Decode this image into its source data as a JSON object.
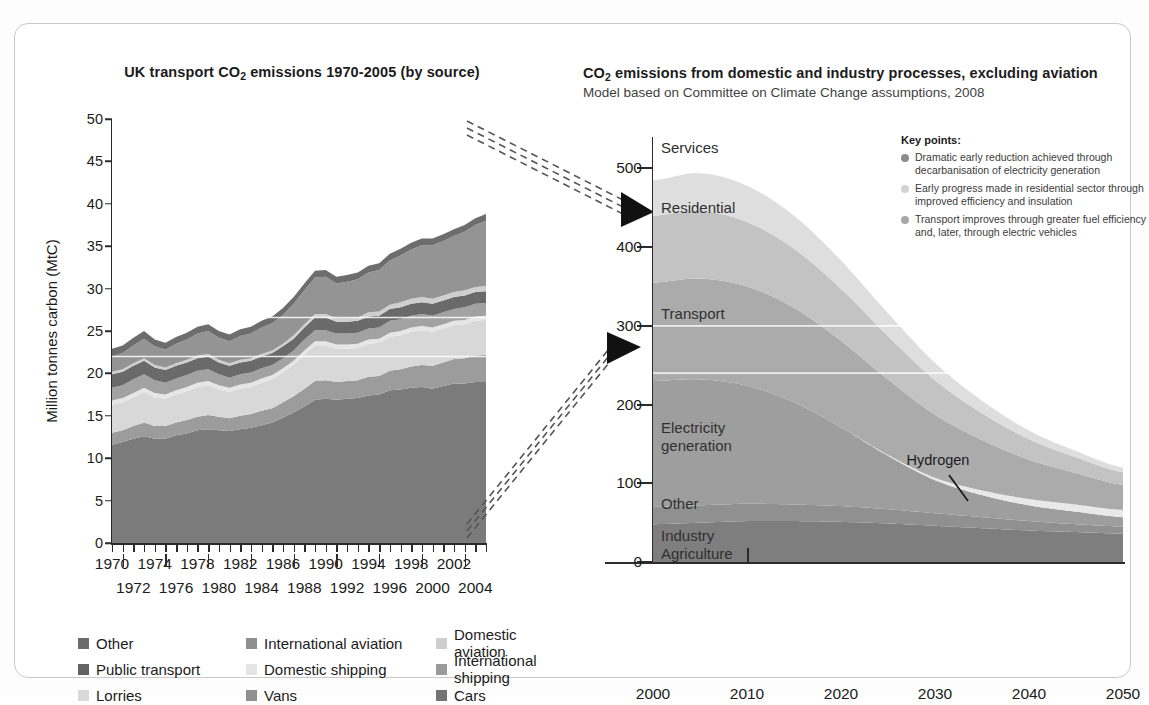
{
  "left": {
    "title_pre": "UK transport CO",
    "title_sub": "2",
    "title_post": " emissions 1970-2005 (by source)",
    "ylabel": "Million tonnes carbon (MtC)",
    "yticks": [
      "0",
      "5",
      "10",
      "15",
      "20",
      "25",
      "30",
      "35",
      "40",
      "45",
      "50"
    ],
    "years_top": [
      "1970",
      "1974",
      "1978",
      "1982",
      "1986",
      "1990",
      "1994",
      "1998",
      "2002"
    ],
    "years_bottom": [
      "1972",
      "1976",
      "1980",
      "1984",
      "1988",
      "1992",
      "1996",
      "2000",
      "2004"
    ]
  },
  "right": {
    "title_pre": "CO",
    "title_sub": "2",
    "title_post": " emissions from domestic and industry processes, excluding aviation",
    "subtitle": "Model based on Committee on Climate Change assumptions, 2008",
    "yticks": [
      "0",
      "100",
      "200",
      "300",
      "400",
      "500"
    ],
    "xticks": [
      "2000",
      "2010",
      "2020",
      "2030",
      "2040",
      "2050"
    ],
    "band_labels": [
      "Services",
      "Residential",
      "Transport",
      "Electricity",
      "generation",
      "Other",
      "Industry",
      "Agriculture"
    ],
    "annotation": "Hydrogen",
    "keypoints": {
      "heading": "Key points:",
      "items": [
        "Dramatic early reduction achieved through decarbanisation of electricity generation",
        "Early progress made in residential sector through improved efficiency and insulation",
        "Transport improves through greater fuel efficiency and, later, through electric vehicles"
      ],
      "dot_colors": [
        "#8c8c8c",
        "#d2d2d2",
        "#a8a8a8"
      ]
    }
  },
  "legend": {
    "items": [
      {
        "label": "Other",
        "color": "#6b6b6b"
      },
      {
        "label": "Public transport",
        "color": "#636363"
      },
      {
        "label": "Lorries",
        "color": "#d9d9d9"
      },
      {
        "label": "International aviation",
        "color": "#8f8f8f"
      },
      {
        "label": "Domestic shipping",
        "color": "#e4e4e4"
      },
      {
        "label": "Vans",
        "color": "#909090"
      },
      {
        "label": "Domestic aviation",
        "color": "#cfcfcf"
      },
      {
        "label": "International shipping",
        "color": "#9a9a9a"
      },
      {
        "label": "Cars",
        "color": "#737373"
      }
    ]
  },
  "colors": {
    "cars": "#7b7b7b",
    "vans": "#9c9c9c",
    "lorries": "#d8d8d8",
    "domestic_shipping": "#e6e6e6",
    "intl_shipping": "#a2a2a2",
    "public_transport": "#6a6a6a",
    "domestic_aviation": "#cfcfcf",
    "intl_aviation": "#949494",
    "other": "#6d6d6d",
    "r_agri_industry": "#7e7e7e",
    "r_other": "#909090",
    "r_electricity": "#9e9e9e",
    "r_hydrogen": "#e9e9e9",
    "r_transport": "#ababab",
    "r_residential": "#c3c3c3",
    "r_services": "#dedede"
  },
  "chart_data": [
    {
      "type": "area",
      "stacked": true,
      "title": "UK transport CO2 emissions 1970-2005 (by source)",
      "xlabel": "",
      "ylabel": "Million tonnes carbon (MtC)",
      "ylim": [
        0,
        50
      ],
      "xlim": [
        1970,
        2005
      ],
      "grid": false,
      "legend_position": "bottom",
      "yticks": [
        0,
        5,
        10,
        15,
        20,
        25,
        30,
        35,
        40,
        45,
        50
      ],
      "x": [
        1970,
        1971,
        1972,
        1973,
        1974,
        1975,
        1976,
        1977,
        1978,
        1979,
        1980,
        1981,
        1982,
        1983,
        1984,
        1985,
        1986,
        1987,
        1988,
        1989,
        1990,
        1991,
        1992,
        1993,
        1994,
        1995,
        1996,
        1997,
        1998,
        1999,
        2000,
        2001,
        2002,
        2003,
        2004,
        2005
      ],
      "series": [
        {
          "name": "Cars",
          "color": "#7b7b7b",
          "values": [
            11.6,
            11.9,
            12.3,
            12.6,
            12.3,
            12.3,
            12.7,
            12.9,
            13.3,
            13.4,
            13.3,
            13.2,
            13.4,
            13.6,
            13.9,
            14.2,
            14.8,
            15.4,
            16.1,
            16.9,
            17.0,
            16.9,
            17.0,
            17.1,
            17.4,
            17.5,
            18.0,
            18.1,
            18.3,
            18.4,
            18.2,
            18.5,
            18.8,
            18.8,
            19.0,
            19.0
          ]
        },
        {
          "name": "Vans",
          "color": "#9c9c9c",
          "values": [
            1.4,
            1.4,
            1.5,
            1.6,
            1.5,
            1.5,
            1.5,
            1.6,
            1.6,
            1.7,
            1.6,
            1.5,
            1.6,
            1.6,
            1.7,
            1.7,
            1.8,
            1.9,
            2.1,
            2.2,
            2.2,
            2.1,
            2.1,
            2.1,
            2.2,
            2.2,
            2.3,
            2.4,
            2.5,
            2.6,
            2.7,
            2.8,
            2.9,
            3.0,
            3.1,
            3.2
          ]
        },
        {
          "name": "Lorries",
          "color": "#d8d8d8",
          "values": [
            3.3,
            3.3,
            3.4,
            3.6,
            3.4,
            3.2,
            3.3,
            3.4,
            3.5,
            3.5,
            3.2,
            3.1,
            3.2,
            3.2,
            3.3,
            3.4,
            3.5,
            3.7,
            4.0,
            4.2,
            4.1,
            3.9,
            3.8,
            3.8,
            3.9,
            3.9,
            4.0,
            4.0,
            4.1,
            4.1,
            4.0,
            4.0,
            4.0,
            4.0,
            4.1,
            4.1
          ]
        },
        {
          "name": "Domestic shipping",
          "color": "#e6e6e6",
          "values": [
            0.5,
            0.5,
            0.5,
            0.5,
            0.5,
            0.5,
            0.5,
            0.5,
            0.5,
            0.5,
            0.5,
            0.5,
            0.5,
            0.5,
            0.5,
            0.5,
            0.5,
            0.5,
            0.5,
            0.5,
            0.5,
            0.5,
            0.5,
            0.5,
            0.5,
            0.5,
            0.5,
            0.5,
            0.5,
            0.5,
            0.5,
            0.5,
            0.5,
            0.5,
            0.5,
            0.5
          ]
        },
        {
          "name": "International shipping",
          "color": "#a2a2a2",
          "values": [
            1.5,
            1.5,
            1.6,
            1.6,
            1.5,
            1.4,
            1.4,
            1.4,
            1.4,
            1.4,
            1.3,
            1.2,
            1.2,
            1.2,
            1.2,
            1.2,
            1.2,
            1.2,
            1.3,
            1.3,
            1.3,
            1.3,
            1.3,
            1.3,
            1.3,
            1.3,
            1.4,
            1.4,
            1.4,
            1.4,
            1.4,
            1.4,
            1.4,
            1.5,
            1.5,
            1.5
          ]
        },
        {
          "name": "Public transport",
          "color": "#6a6a6a",
          "values": [
            1.6,
            1.6,
            1.6,
            1.6,
            1.5,
            1.5,
            1.5,
            1.5,
            1.5,
            1.5,
            1.4,
            1.4,
            1.4,
            1.4,
            1.4,
            1.4,
            1.4,
            1.4,
            1.4,
            1.5,
            1.5,
            1.4,
            1.4,
            1.4,
            1.4,
            1.4,
            1.4,
            1.4,
            1.4,
            1.4,
            1.4,
            1.4,
            1.4,
            1.4,
            1.4,
            1.4
          ]
        },
        {
          "name": "Domestic aviation",
          "color": "#cfcfcf",
          "values": [
            0.3,
            0.3,
            0.3,
            0.3,
            0.3,
            0.3,
            0.3,
            0.3,
            0.3,
            0.3,
            0.3,
            0.3,
            0.3,
            0.3,
            0.3,
            0.3,
            0.3,
            0.4,
            0.4,
            0.4,
            0.4,
            0.4,
            0.4,
            0.4,
            0.5,
            0.5,
            0.5,
            0.6,
            0.6,
            0.6,
            0.6,
            0.6,
            0.6,
            0.6,
            0.6,
            0.6
          ]
        },
        {
          "name": "International aviation",
          "color": "#949494",
          "values": [
            1.8,
            1.9,
            2.1,
            2.3,
            2.2,
            2.1,
            2.3,
            2.4,
            2.6,
            2.7,
            2.6,
            2.6,
            2.8,
            2.9,
            3.1,
            3.2,
            3.4,
            3.7,
            4.0,
            4.3,
            4.4,
            4.1,
            4.3,
            4.5,
            4.7,
            4.9,
            5.2,
            5.5,
            5.8,
            6.1,
            6.3,
            6.4,
            6.6,
            6.9,
            7.3,
            7.7
          ]
        },
        {
          "name": "Other",
          "color": "#6d6d6d",
          "values": [
            0.9,
            0.9,
            0.9,
            0.9,
            0.8,
            0.8,
            0.8,
            0.8,
            0.8,
            0.8,
            0.8,
            0.8,
            0.8,
            0.8,
            0.8,
            0.8,
            0.8,
            0.8,
            0.8,
            0.8,
            0.8,
            0.8,
            0.8,
            0.8,
            0.8,
            0.8,
            0.8,
            0.8,
            0.8,
            0.8,
            0.8,
            0.8,
            0.8,
            0.8,
            0.8,
            0.8
          ]
        }
      ]
    },
    {
      "type": "area",
      "stacked": true,
      "title": "CO2 emissions from domestic and industry processes, excluding aviation",
      "subtitle": "Model based on Committee on Climate Change assumptions, 2008",
      "xlabel": "",
      "ylabel": "",
      "ylim": [
        0,
        540
      ],
      "xlim": [
        2000,
        2050
      ],
      "grid": false,
      "legend_position": "inline-labels",
      "yticks": [
        0,
        100,
        200,
        300,
        400,
        500
      ],
      "xticks": [
        2000,
        2010,
        2020,
        2030,
        2040,
        2050
      ],
      "x": [
        2000,
        2005,
        2010,
        2015,
        2020,
        2025,
        2030,
        2035,
        2040,
        2045,
        2050
      ],
      "series": [
        {
          "name": "Agriculture / Industry",
          "color": "#7e7e7e",
          "values": [
            48,
            50,
            52,
            52,
            51,
            49,
            46,
            43,
            40,
            38,
            36
          ]
        },
        {
          "name": "Other",
          "color": "#909090",
          "values": [
            22,
            22,
            22,
            21,
            20,
            18,
            16,
            14,
            12,
            10,
            9
          ]
        },
        {
          "name": "Electricity generation",
          "color": "#9e9e9e",
          "values": [
            160,
            160,
            150,
            130,
            100,
            68,
            42,
            28,
            20,
            16,
            12
          ]
        },
        {
          "name": "Hydrogen",
          "color": "#e9e9e9",
          "values": [
            0,
            0,
            0,
            0,
            0,
            1,
            3,
            6,
            8,
            9,
            9
          ]
        },
        {
          "name": "Transport",
          "color": "#ababab",
          "values": [
            125,
            128,
            126,
            120,
            110,
            96,
            80,
            64,
            50,
            40,
            32
          ]
        },
        {
          "name": "Residential",
          "color": "#c3c3c3",
          "values": [
            85,
            86,
            82,
            75,
            66,
            55,
            44,
            34,
            26,
            20,
            16
          ]
        },
        {
          "name": "Services",
          "color": "#dedede",
          "values": [
            45,
            48,
            46,
            42,
            36,
            29,
            22,
            16,
            11,
            8,
            6
          ]
        }
      ],
      "annotations": [
        {
          "text": "Hydrogen",
          "x": 2040,
          "y": 85
        }
      ]
    }
  ]
}
